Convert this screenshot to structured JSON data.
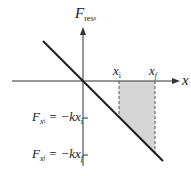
{
  "diagram": {
    "y_axis_label": {
      "main": "F",
      "sub": "res",
      "subsub": "x"
    },
    "x_axis_label": "x",
    "x_ticks": [
      {
        "main": "x",
        "sub": "i"
      },
      {
        "main": "x",
        "sub": "f"
      }
    ],
    "y_ticks": [
      {
        "lhs_main": "F",
        "lhs_sub": "x",
        "lhs_subsub": "i",
        "rhs": "= −kx",
        "rhs_sub": "i"
      },
      {
        "lhs_main": "F",
        "lhs_sub": "x",
        "lhs_subsub": "f",
        "rhs": "= −kx",
        "rhs_sub": "f"
      }
    ],
    "colors": {
      "line": "#222222",
      "axis": "#333333",
      "shade": "#d6d6d6"
    }
  }
}
